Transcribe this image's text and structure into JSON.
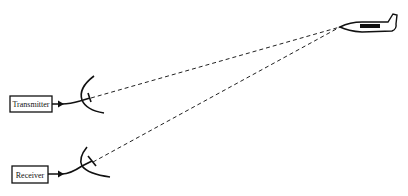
{
  "diagram": {
    "type": "radar-bistatic-schematic",
    "nodes": {
      "transmitter": {
        "label": "Transmitter"
      },
      "receiver": {
        "label": "Receiver"
      },
      "aircraft": {
        "label": ""
      }
    },
    "edges": [
      {
        "from": "transmitter",
        "to": "transmitter-antenna",
        "style": "solid-arrow"
      },
      {
        "from": "transmitter-antenna",
        "to": "aircraft",
        "style": "dashed"
      },
      {
        "from": "aircraft",
        "to": "receiver-antenna",
        "style": "dashed"
      },
      {
        "from": "receiver-antenna",
        "to": "receiver",
        "style": "solid-arrow"
      }
    ]
  },
  "colors": {
    "line": "#111111",
    "background": "#ffffff"
  }
}
